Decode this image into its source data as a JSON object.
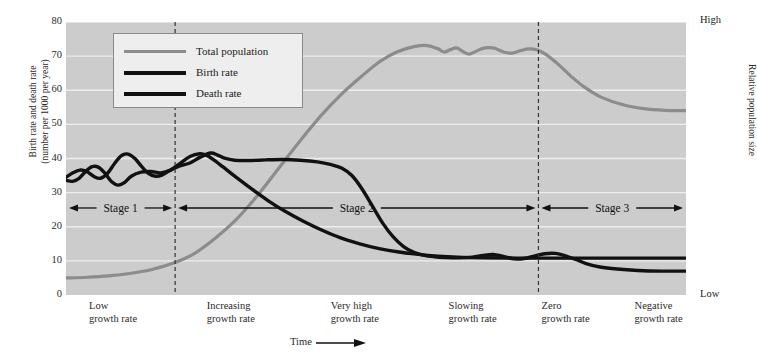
{
  "axes": {
    "y_left_title": "Birth rate and death rate\n(number per 1000 per year)",
    "y_right_title": "Relative population size",
    "y_right_high": "High",
    "y_right_low": "Low",
    "x_title": "Time",
    "y_ticks": [
      "80",
      "70",
      "60",
      "50",
      "40",
      "30",
      "20",
      "10",
      "0"
    ]
  },
  "legend": {
    "items": [
      {
        "label": "Total population",
        "color": "#8c8c8c",
        "width": 3.2
      },
      {
        "label": "Birth rate",
        "color": "#111111",
        "width": 4.2
      },
      {
        "label": "Death rate",
        "color": "#111111",
        "width": 4.2
      }
    ]
  },
  "stages": [
    {
      "label": "Stage 1"
    },
    {
      "label": "Stage 2"
    },
    {
      "label": "Stage 3"
    }
  ],
  "x_captions": [
    "Low\ngrowth rate",
    "Increasing\ngrowth rate",
    "Very high\ngrowth rate",
    "Slowing\ngrowth rate",
    "Zero\ngrowth rate",
    "Negative\ngrowth rate"
  ],
  "chart_data": {
    "type": "line",
    "title": "",
    "xlabel": "Time",
    "ylabel": "Birth rate and death rate (number per 1000 per year)",
    "ylabel_right": "Relative population size",
    "ylim": [
      0,
      80
    ],
    "yticks": [
      0,
      10,
      20,
      30,
      40,
      50,
      60,
      70,
      80
    ],
    "grid": "horizontal",
    "legend_position": "top-left",
    "x_range": [
      0,
      100
    ],
    "stage_dividers_x": [
      17.6,
      76.2
    ],
    "series": [
      {
        "name": "Total population",
        "color": "#8c8c8c",
        "axis": "right",
        "points": [
          [
            0,
            5
          ],
          [
            5,
            5.2
          ],
          [
            10,
            5.6
          ],
          [
            15,
            6.3
          ],
          [
            20,
            7.4
          ],
          [
            25,
            9.2
          ],
          [
            30,
            12
          ],
          [
            35,
            16.5
          ],
          [
            40,
            22
          ],
          [
            45,
            29
          ],
          [
            50,
            37
          ],
          [
            55,
            45
          ],
          [
            60,
            52.5
          ],
          [
            65,
            59
          ],
          [
            70,
            64.5
          ],
          [
            74,
            68.5
          ],
          [
            78,
            71.3
          ],
          [
            82,
            72.8
          ],
          [
            85,
            73.1
          ],
          [
            87.5,
            72.2
          ],
          [
            89,
            71.2
          ],
          [
            90.5,
            71.9
          ],
          [
            92,
            72.4
          ],
          [
            93.5,
            71.3
          ],
          [
            95,
            70.6
          ],
          [
            96.5,
            71.4
          ],
          [
            98,
            72.2
          ],
          [
            99.5,
            72.5
          ],
          [
            101,
            72.3
          ],
          [
            103,
            71.2
          ],
          [
            105,
            70.9
          ],
          [
            107,
            71.6
          ],
          [
            109,
            72.1
          ],
          [
            111,
            71.8
          ],
          [
            113,
            70.5
          ],
          [
            116,
            67.5
          ],
          [
            119,
            64
          ],
          [
            122,
            61
          ],
          [
            126,
            58
          ],
          [
            131,
            55.8
          ],
          [
            136,
            54.6
          ],
          [
            141,
            54.1
          ],
          [
            146,
            54
          ]
        ]
      },
      {
        "name": "Birth rate",
        "color": "#111111",
        "axis": "left",
        "points": [
          [
            0,
            34.5
          ],
          [
            2,
            35.8
          ],
          [
            4,
            36.6
          ],
          [
            6,
            36.2
          ],
          [
            8,
            34.8
          ],
          [
            10,
            34.2
          ],
          [
            12,
            35.6
          ],
          [
            14,
            38.4
          ],
          [
            16,
            40.8
          ],
          [
            18,
            41.3
          ],
          [
            20,
            40
          ],
          [
            22,
            37.6
          ],
          [
            24,
            35.6
          ],
          [
            26,
            34.8
          ],
          [
            28,
            35.2
          ],
          [
            30,
            36.4
          ],
          [
            33,
            37.8
          ],
          [
            36,
            38.7
          ],
          [
            39,
            40.4
          ],
          [
            42,
            41.6
          ],
          [
            44,
            41
          ],
          [
            46,
            40.1
          ],
          [
            49,
            39.5
          ],
          [
            53,
            39.4
          ],
          [
            58,
            39.6
          ],
          [
            63,
            39.7
          ],
          [
            68,
            39.5
          ],
          [
            73,
            39
          ],
          [
            77,
            38.2
          ],
          [
            80,
            37.2
          ],
          [
            83,
            35
          ],
          [
            86,
            31
          ],
          [
            89,
            26
          ],
          [
            92,
            21
          ],
          [
            95,
            17
          ],
          [
            98,
            14.2
          ],
          [
            101,
            12.5
          ],
          [
            104,
            11.6
          ],
          [
            107,
            11.2
          ],
          [
            110,
            11
          ],
          [
            114,
            10.9
          ],
          [
            118,
            11.1
          ],
          [
            121,
            11.6
          ],
          [
            124,
            11.9
          ],
          [
            127,
            11.3
          ],
          [
            130,
            10.6
          ],
          [
            133,
            10.7
          ],
          [
            136,
            11.4
          ],
          [
            139,
            12.1
          ],
          [
            142,
            12.2
          ],
          [
            145,
            11.5
          ],
          [
            148,
            10.4
          ],
          [
            151,
            9.2
          ],
          [
            155,
            8.2
          ],
          [
            160,
            7.6
          ],
          [
            166,
            7.2
          ],
          [
            173,
            7
          ],
          [
            180,
            7
          ]
        ]
      },
      {
        "name": "Death rate",
        "color": "#111111",
        "axis": "left",
        "points": [
          [
            0,
            33.6
          ],
          [
            2,
            33.3
          ],
          [
            4,
            34.2
          ],
          [
            6,
            36.2
          ],
          [
            8,
            37.6
          ],
          [
            10,
            37.4
          ],
          [
            12,
            35.6
          ],
          [
            14,
            33.2
          ],
          [
            16,
            32.2
          ],
          [
            18,
            33
          ],
          [
            20,
            34.8
          ],
          [
            23,
            36
          ],
          [
            26,
            36.2
          ],
          [
            29,
            35.8
          ],
          [
            32,
            36.6
          ],
          [
            35,
            38.6
          ],
          [
            38,
            40.6
          ],
          [
            41,
            41.4
          ],
          [
            43,
            41
          ],
          [
            45,
            39.8
          ],
          [
            48,
            37.6
          ],
          [
            52,
            34.6
          ],
          [
            57,
            31
          ],
          [
            62,
            27.6
          ],
          [
            67,
            24.6
          ],
          [
            72,
            22
          ],
          [
            78,
            19.2
          ],
          [
            84,
            16.8
          ],
          [
            90,
            15
          ],
          [
            96,
            13.6
          ],
          [
            102,
            12.6
          ],
          [
            108,
            11.9
          ],
          [
            114,
            11.4
          ],
          [
            120,
            11.1
          ],
          [
            128,
            10.9
          ],
          [
            138,
            10.8
          ],
          [
            150,
            10.8
          ],
          [
            162,
            10.8
          ],
          [
            175,
            10.8
          ],
          [
            190,
            10.8
          ]
        ]
      }
    ],
    "annotations": [
      {
        "text": "Stage 1",
        "x_range": [
          0,
          17.6
        ]
      },
      {
        "text": "Stage 2",
        "x_range": [
          17.6,
          76.2
        ]
      },
      {
        "text": "Stage 3",
        "x_range": [
          76.2,
          100
        ]
      },
      {
        "text": "Low growth rate",
        "x": 5
      },
      {
        "text": "Increasing growth rate",
        "x": 24
      },
      {
        "text": "Very high growth rate",
        "x": 44
      },
      {
        "text": "Slowing growth rate",
        "x": 63
      },
      {
        "text": "Zero growth rate",
        "x": 78
      },
      {
        "text": "Negative growth rate",
        "x": 93
      }
    ]
  }
}
